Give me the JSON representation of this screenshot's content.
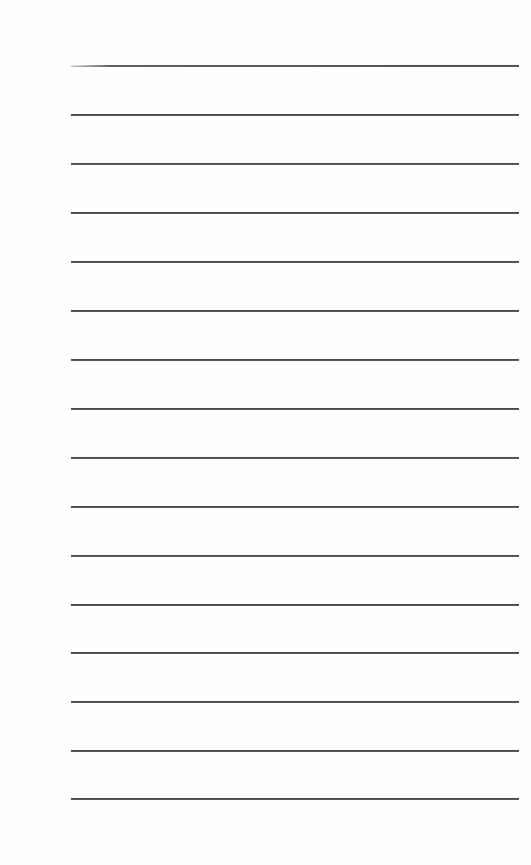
{
  "page": {
    "type": "lined-paper",
    "background_color": "#fefefe",
    "line_color": "#4a4a4a",
    "line_count": 16,
    "line_left_x": 71,
    "line_right_x": 519,
    "line_positions_y": [
      65,
      114,
      163,
      212,
      261,
      310,
      359,
      408,
      457,
      506,
      555,
      604,
      652,
      701,
      750,
      798
    ]
  }
}
